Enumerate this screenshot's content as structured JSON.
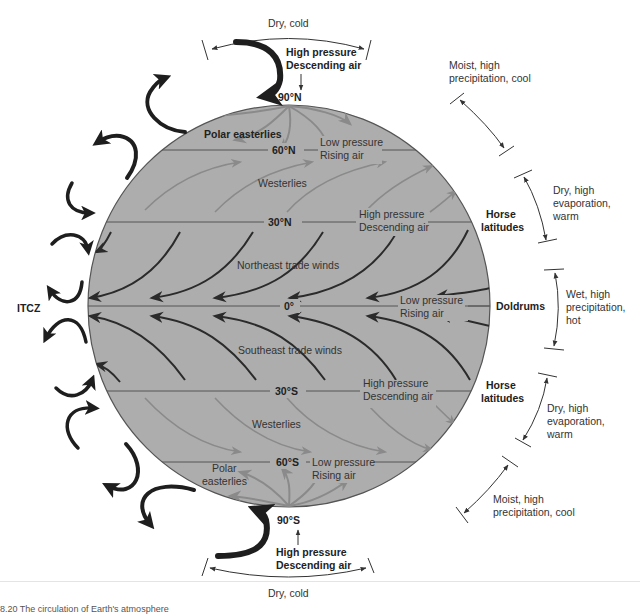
{
  "figure": {
    "caption_fragment": "8.20 The circulation of Earth's atmosphere",
    "globe_color": "#adadad",
    "globe_edge_color": "#555555",
    "latitude_line_color": "#555555",
    "trade_wind_color": "#2b2b2b",
    "westerly_color": "#8a8a8a",
    "cell_arrow_color": "#1e1e1e"
  },
  "latitudes": {
    "n90": "90°N",
    "n60": "60°N",
    "n30": "30°N",
    "eq": "0°",
    "s30": "30°S",
    "s60": "60°S",
    "s90": "90°S"
  },
  "winds": {
    "polar_easterlies_n": "Polar easterlies",
    "westerlies_n": "Westerlies",
    "ne_trades": "Northeast trade winds",
    "se_trades": "Southeast trade winds",
    "westerlies_s": "Westerlies",
    "polar_easterlies_s_line1": "Polar",
    "polar_easterlies_s_line2": "easterlies"
  },
  "pressure": {
    "n90": [
      "High pressure",
      "Descending air"
    ],
    "n60": [
      "Low pressure",
      "Rising air"
    ],
    "n30": [
      "High pressure",
      "Descending air"
    ],
    "eq": [
      "Low pressure",
      "Rising air"
    ],
    "s30": [
      "High pressure",
      "Descending air"
    ],
    "s60": [
      "Low pressure",
      "Rising air"
    ],
    "s90": [
      "High pressure",
      "Descending air"
    ]
  },
  "zones": {
    "itcz": "ITCZ",
    "horse_latitudes_n": [
      "Horse",
      "latitudes"
    ],
    "doldrums": "Doldrums",
    "horse_latitudes_s": [
      "Horse",
      "latitudes"
    ]
  },
  "climate": {
    "top": "Dry, cold",
    "n_polar_front": [
      "Moist, high",
      "precipitation, cool"
    ],
    "n_subtropic": [
      "Dry, high",
      "evaporation,",
      "warm"
    ],
    "equatorial": [
      "Wet, high",
      "precipitation,",
      "hot"
    ],
    "s_subtropic": [
      "Dry, high",
      "evaporation,",
      "warm"
    ],
    "s_polar_front": [
      "Moist, high",
      "precipitation, cool"
    ],
    "bottom": "Dry, cold"
  }
}
